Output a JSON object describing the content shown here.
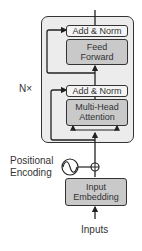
{
  "header": {
    "cropped_text": ""
  },
  "diagram": {
    "repeat_label": "N×",
    "encoder_block": {
      "upper_addnorm": "Add & Norm",
      "feed_forward": [
        "Feed",
        "Forward"
      ],
      "lower_addnorm": "Add & Norm",
      "attention": [
        "Multi-Head",
        "Attention"
      ]
    },
    "positional_encoding": [
      "Positional",
      "Encoding"
    ],
    "input_embedding": [
      "Input",
      "Embedding"
    ],
    "inputs_label": "Inputs",
    "colors": {
      "block_bg": "#ececec",
      "sublayer_bg": "#c9c9c9",
      "addnorm_bg": "#f4f4f4",
      "stroke": "#333333"
    }
  }
}
